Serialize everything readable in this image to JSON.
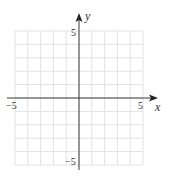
{
  "chart_data": {
    "type": "scatter",
    "title": "",
    "xlabel": "x",
    "ylabel": "y",
    "xlim": [
      -5,
      5
    ],
    "ylim": [
      -5,
      5
    ],
    "grid": true,
    "grid_step": 1,
    "tick_labels": {
      "x": [
        "-5",
        "5"
      ],
      "y": [
        "5",
        "-5"
      ]
    },
    "series": []
  },
  "labels": {
    "x_axis": "x",
    "y_axis": "y",
    "x_min": "−5",
    "x_max": "5",
    "y_max": "5",
    "y_min": "−5"
  },
  "colors": {
    "grid": "#e2e2e2",
    "axis": "#3a3a3a",
    "text": "#333333"
  }
}
